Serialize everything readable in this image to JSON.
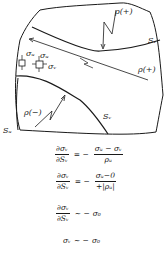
{
  "figure": {
    "type": "stress-trajectory sketch",
    "labels": {
      "rho_plus_top": "ρ(+)",
      "rho_plus_mid": "ρ(+)",
      "rho_minus": "ρ(−)",
      "s_v_right": "Sᵥ",
      "s_v_bottom": "Sᵥ",
      "s_u_left": "Sᵤ",
      "sigma_u_element1": "σᵤ",
      "sigma_u_element2": "σᵤ",
      "sigma_v_element2": "σᵥ"
    }
  },
  "equations": [
    {
      "lhs_num": "∂σᵥ",
      "lhs_den": "∂Sᵥ",
      "rel": "= −",
      "rhs_num": "σᵤ − σᵥ",
      "rhs_den": "ρᵤ"
    },
    {
      "lhs_num": "∂σᵥ",
      "lhs_den": "∂Sᵥ",
      "rel": "= −",
      "rhs_num": "σᵤ−0",
      "rhs_den": "+|ρᵤ|"
    },
    {
      "lhs_num": "∂σᵥ",
      "lhs_den": "∂Sᵥ",
      "rel": "∼ −",
      "rhs": "σ₀"
    },
    {
      "lhs": "σᵥ",
      "rel": "∼ −",
      "rhs": "σ₀"
    }
  ]
}
